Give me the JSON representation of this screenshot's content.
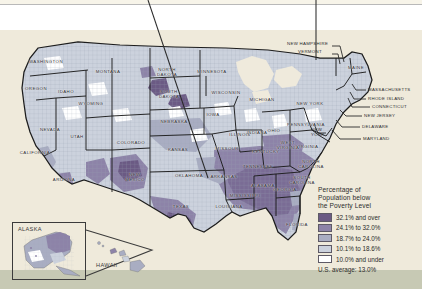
{
  "figure": {
    "kind": "choropleth-map"
  },
  "legend": {
    "title_lines": [
      "Percentage of",
      "Population below",
      "the Poverty Level"
    ],
    "classes": [
      {
        "label": "32.1% and over",
        "color": "#6b5a84",
        "min": 32.1,
        "max": null
      },
      {
        "label": "24.1% to 32.0%",
        "color": "#8d83a8",
        "min": 24.1,
        "max": 32.0
      },
      {
        "label": "18.7% to 24.0%",
        "color": "#a9adc2",
        "min": 18.7,
        "max": 24.0
      },
      {
        "label": "10.1% to 18.6%",
        "color": "#ccd2dd",
        "min": 10.1,
        "max": 18.6
      },
      {
        "label": "10.0% and under",
        "color": "#ffffff",
        "min": null,
        "max": 10.0
      }
    ],
    "average_note": "U.S. average: 13.0%"
  },
  "insets": {
    "alaska_label": "ALASKA",
    "hawaii_label": "HAWAII"
  },
  "colors": {
    "page_background": "#f7f4e9",
    "sage_band": "#c7c9b4",
    "ocean": "#efeadc",
    "state_border": "#1d1d1d",
    "county_border": "#8e93a3",
    "leader_line": "#2b2b2b"
  },
  "state_labels": [
    {
      "name": "WASHINGTON",
      "x": 46,
      "y": 62,
      "mode": "inline"
    },
    {
      "name": "OREGON",
      "x": 36,
      "y": 89,
      "mode": "inline"
    },
    {
      "name": "IDAHO",
      "x": 66,
      "y": 92,
      "mode": "inline"
    },
    {
      "name": "MONTANA",
      "x": 108,
      "y": 72,
      "mode": "inline"
    },
    {
      "name": "WYOMING",
      "x": 91,
      "y": 104,
      "mode": "inline"
    },
    {
      "name": "NEVADA",
      "x": 50,
      "y": 130,
      "mode": "inline"
    },
    {
      "name": "UTAH",
      "x": 77,
      "y": 137,
      "mode": "inline"
    },
    {
      "name": "CALIFORNIA",
      "x": 35,
      "y": 153,
      "mode": "inline"
    },
    {
      "name": "ARIZONA",
      "x": 64,
      "y": 180,
      "mode": "inline"
    },
    {
      "name": "NORTH\nDAKOTA",
      "x": 167,
      "y": 73,
      "mode": "inline"
    },
    {
      "name": "SOUTH\nDAKOTA",
      "x": 169,
      "y": 95,
      "mode": "inline"
    },
    {
      "name": "NEBRASKA",
      "x": 174,
      "y": 122,
      "mode": "inline"
    },
    {
      "name": "MINNESOTA",
      "x": 212,
      "y": 72,
      "mode": "inline"
    },
    {
      "name": "COLORADO",
      "x": 131,
      "y": 143,
      "mode": "inline"
    },
    {
      "name": "KANSAS",
      "x": 178,
      "y": 150,
      "mode": "inline"
    },
    {
      "name": "NEW\nMEXICO",
      "x": 135,
      "y": 178,
      "mode": "inline"
    },
    {
      "name": "OKLAHOMA",
      "x": 189,
      "y": 176,
      "mode": "inline"
    },
    {
      "name": "TEXAS",
      "x": 181,
      "y": 207,
      "mode": "inline"
    },
    {
      "name": "MISSOURI",
      "x": 228,
      "y": 149,
      "mode": "inline"
    },
    {
      "name": "IOWA",
      "x": 213,
      "y": 115,
      "mode": "inline"
    },
    {
      "name": "ARKANSAS",
      "x": 224,
      "y": 177,
      "mode": "inline"
    },
    {
      "name": "LOUISIANA",
      "x": 229,
      "y": 207,
      "mode": "inline"
    },
    {
      "name": "MISSISSIPPI",
      "x": 245,
      "y": 196,
      "mode": "inline"
    },
    {
      "name": "ALABAMA",
      "x": 263,
      "y": 186,
      "mode": "inline"
    },
    {
      "name": "GEORGIA",
      "x": 285,
      "y": 190,
      "mode": "inline"
    },
    {
      "name": "FLORIDA",
      "x": 297,
      "y": 225,
      "mode": "inline"
    },
    {
      "name": "TENNESSEE",
      "x": 258,
      "y": 167,
      "mode": "inline"
    },
    {
      "name": "KENTUCKY",
      "x": 266,
      "y": 152,
      "mode": "inline"
    },
    {
      "name": "WISCONSIN",
      "x": 226,
      "y": 93,
      "mode": "inline"
    },
    {
      "name": "MICHIGAN",
      "x": 262,
      "y": 100,
      "mode": "inline"
    },
    {
      "name": "ILLINOIS",
      "x": 240,
      "y": 135,
      "mode": "inline"
    },
    {
      "name": "INDIANA",
      "x": 257,
      "y": 133,
      "mode": "inline"
    },
    {
      "name": "OHIO",
      "x": 274,
      "y": 131,
      "mode": "inline"
    },
    {
      "name": "PENNSYLVANIA",
      "x": 306,
      "y": 125,
      "mode": "inline"
    },
    {
      "name": "NEW YORK",
      "x": 310,
      "y": 104,
      "mode": "inline"
    },
    {
      "name": "WEST\nVIRGINIA",
      "x": 288,
      "y": 146,
      "mode": "inline"
    },
    {
      "name": "VIRGINIA",
      "x": 307,
      "y": 147,
      "mode": "inline"
    },
    {
      "name": "NORTH\nCAROLINA",
      "x": 311,
      "y": 165,
      "mode": "inline"
    },
    {
      "name": "SOUTH\nCAROLINA",
      "x": 302,
      "y": 181,
      "mode": "inline"
    },
    {
      "name": "MAINE",
      "x": 356,
      "y": 68,
      "mode": "inline"
    }
  ],
  "callout_labels": [
    {
      "name": "NEW HAMPSHIRE",
      "x": 287,
      "y": 44,
      "align": "left"
    },
    {
      "name": "VERMONT",
      "x": 298,
      "y": 52,
      "align": "left"
    },
    {
      "name": "NEW\nYORK",
      "x": 311,
      "y": 133,
      "align": "left"
    },
    {
      "name": "MASSACHUSETTS",
      "x": 368,
      "y": 90,
      "align": "left"
    },
    {
      "name": "RHODE ISLAND",
      "x": 368,
      "y": 99,
      "align": "left"
    },
    {
      "name": "CONNECTICUT",
      "x": 372,
      "y": 107,
      "align": "left"
    },
    {
      "name": "NEW JERSEY",
      "x": 364,
      "y": 116,
      "align": "left"
    },
    {
      "name": "DELAWARE",
      "x": 362,
      "y": 127,
      "align": "left"
    },
    {
      "name": "MARYLAND",
      "x": 363,
      "y": 139,
      "align": "left"
    }
  ],
  "chart_data": {
    "type": "heatmap",
    "title": "Percentage of Population below the Poverty Level",
    "unit": "percent",
    "class_breaks": [
      10.0,
      18.6,
      24.0,
      32.0
    ],
    "class_labels": [
      "10.0% and under",
      "10.1% to 18.6%",
      "18.7% to 24.0%",
      "24.1% to 32.0%",
      "32.1% and over"
    ],
    "class_colors": [
      "#ffffff",
      "#ccd2dd",
      "#a9adc2",
      "#8d83a8",
      "#6b5a84"
    ],
    "national_average": 13.0,
    "geography": "United States counties",
    "insets": [
      "ALASKA",
      "HAWAII"
    ],
    "legend_position": "right-bottom",
    "grid": false
  }
}
